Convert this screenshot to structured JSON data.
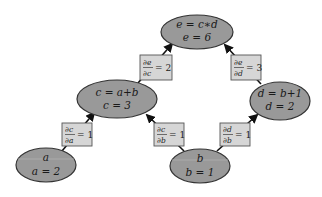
{
  "diagram": {
    "colors": {
      "node_fill": "#999999",
      "node_stroke": "#333333",
      "label_fill": "#d6d6d6",
      "label_stroke": "#555555",
      "edge": "#111111"
    },
    "nodes": [
      {
        "id": "e",
        "expr": "e = c∗d",
        "value": "e = 6",
        "cx": 197,
        "cy": 32,
        "rx": 36,
        "ry": 17
      },
      {
        "id": "c",
        "expr": "c = a+b",
        "value": "c = 3",
        "cx": 117,
        "cy": 99,
        "rx": 40,
        "ry": 19
      },
      {
        "id": "d",
        "expr": "d = b+1",
        "value": "d = 2",
        "cx": 280,
        "cy": 101,
        "rx": 30,
        "ry": 19
      },
      {
        "id": "a",
        "expr": "a",
        "value": "a = 2",
        "cx": 46,
        "cy": 165,
        "rx": 30,
        "ry": 17
      },
      {
        "id": "b",
        "expr": "b",
        "value": "b = 1",
        "cx": 200,
        "cy": 166,
        "rx": 30,
        "ry": 17
      }
    ],
    "edges": [
      {
        "from": "c",
        "to": "e",
        "num": "∂e",
        "den": "∂c",
        "eq": "= 2"
      },
      {
        "from": "d",
        "to": "e",
        "num": "∂e",
        "den": "∂d",
        "eq": "= 3"
      },
      {
        "from": "a",
        "to": "c",
        "num": "∂c",
        "den": "∂a",
        "eq": "= 1"
      },
      {
        "from": "b",
        "to": "c",
        "num": "∂c",
        "den": "∂b",
        "eq": "= 1"
      },
      {
        "from": "b",
        "to": "d",
        "num": "∂d",
        "den": "∂b",
        "eq": "= 1"
      }
    ]
  }
}
